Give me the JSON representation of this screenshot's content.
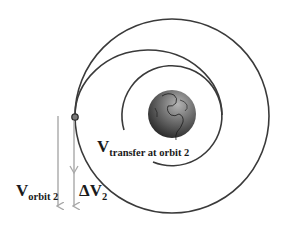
{
  "diagram": {
    "labels": {
      "transfer": {
        "main": "V",
        "sub": "transfer at orbit 2"
      },
      "orbit2": {
        "main": "V",
        "sub": "orbit 2"
      },
      "delta_v": {
        "main": "ΔV",
        "sub": "2"
      }
    },
    "elements": {
      "outer_orbit": "orbit 2 (circular)",
      "inner_orbit": "orbit 1 (circular)",
      "transfer_orbit": "elliptical transfer orbit",
      "central_body": "Earth",
      "burn_point": "apoapsis node"
    },
    "colors": {
      "orbit_line": "#3a3a3a",
      "vector_arrow": "#a8a8a8",
      "earth_dark": "#2a2a2a",
      "earth_light": "#9a9a9a",
      "text": "#1a1a1a"
    }
  }
}
